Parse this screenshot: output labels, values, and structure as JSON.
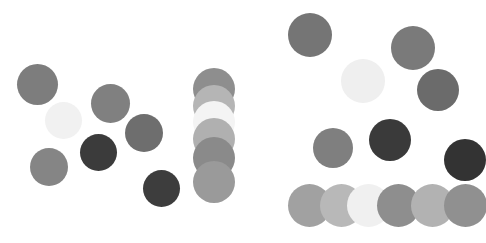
{
  "figure": {
    "width": 486,
    "height": 243,
    "background_color": "#ffffff",
    "panel_count": 2
  },
  "panels": [
    {
      "name": "left-panel",
      "origin_x": 0,
      "origin_y": 0,
      "width": 243,
      "height": 243,
      "dots": [
        {
          "name": "dot-l1",
          "cx": 37,
          "cy": 84,
          "r": 20.5,
          "color": "#7d7d7d"
        },
        {
          "name": "dot-l2",
          "cx": 63,
          "cy": 120,
          "r": 18.5,
          "color": "#f1f1f1"
        },
        {
          "name": "dot-l3",
          "cx": 110,
          "cy": 103,
          "r": 19.5,
          "color": "#808080"
        },
        {
          "name": "dot-l4",
          "cx": 98,
          "cy": 152,
          "r": 18.5,
          "color": "#3b3b3b"
        },
        {
          "name": "dot-l5",
          "cx": 49,
          "cy": 167,
          "r": 19.0,
          "color": "#858585"
        },
        {
          "name": "dot-l6",
          "cx": 144,
          "cy": 133,
          "r": 19.0,
          "color": "#6e6e6e"
        },
        {
          "name": "dot-l7",
          "cx": 161,
          "cy": 188,
          "r": 18.5,
          "color": "#3d3d3d"
        },
        {
          "name": "dot-c1",
          "cx": 214,
          "cy": 89,
          "r": 21.0,
          "color": "#8e8e8e"
        },
        {
          "name": "dot-c2",
          "cx": 214,
          "cy": 106,
          "r": 21.0,
          "color": "#b5b5b5"
        },
        {
          "name": "dot-c3",
          "cx": 214,
          "cy": 122,
          "r": 21.0,
          "color": "#f4f4f4"
        },
        {
          "name": "dot-c4",
          "cx": 214,
          "cy": 139,
          "r": 21.0,
          "color": "#b0b0b0"
        },
        {
          "name": "dot-c5",
          "cx": 214,
          "cy": 158,
          "r": 21.0,
          "color": "#8a8a8a"
        },
        {
          "name": "dot-c6",
          "cx": 214,
          "cy": 182,
          "r": 21.0,
          "color": "#9a9a9a"
        }
      ]
    },
    {
      "name": "right-panel",
      "origin_x": 243,
      "origin_y": 0,
      "width": 243,
      "height": 243,
      "dots": [
        {
          "name": "dot-r1",
          "cx": 310,
          "cy": 35,
          "r": 22.0,
          "color": "#757575"
        },
        {
          "name": "dot-r2",
          "cx": 413,
          "cy": 48,
          "r": 22.0,
          "color": "#7a7a7a"
        },
        {
          "name": "dot-r3",
          "cx": 363,
          "cy": 81,
          "r": 22.0,
          "color": "#efefef"
        },
        {
          "name": "dot-r4",
          "cx": 438,
          "cy": 90,
          "r": 21.0,
          "color": "#6b6b6b"
        },
        {
          "name": "dot-r5",
          "cx": 333,
          "cy": 148,
          "r": 20.0,
          "color": "#7f7f7f"
        },
        {
          "name": "dot-r6",
          "cx": 390,
          "cy": 140,
          "r": 21.0,
          "color": "#3a3a3a"
        },
        {
          "name": "dot-r7",
          "cx": 465,
          "cy": 160,
          "r": 21.0,
          "color": "#333333"
        },
        {
          "name": "dot-b1",
          "cx": 309,
          "cy": 205,
          "r": 21.5,
          "color": "#a1a1a1"
        },
        {
          "name": "dot-b2",
          "cx": 341,
          "cy": 205,
          "r": 21.5,
          "color": "#b8b8b8"
        },
        {
          "name": "dot-b3",
          "cx": 368,
          "cy": 205,
          "r": 21.5,
          "color": "#f0f0f0"
        },
        {
          "name": "dot-b4",
          "cx": 398,
          "cy": 205,
          "r": 21.5,
          "color": "#8e8e8e"
        },
        {
          "name": "dot-b5",
          "cx": 432,
          "cy": 205,
          "r": 21.5,
          "color": "#b2b2b2"
        },
        {
          "name": "dot-b6",
          "cx": 465,
          "cy": 205,
          "r": 21.5,
          "color": "#909090"
        }
      ]
    }
  ],
  "chart_data": {
    "type": "scatter",
    "subtitle": "",
    "xlabel": "",
    "ylabel": "",
    "xlim": [
      0,
      486
    ],
    "ylim": [
      0,
      243
    ],
    "grid": false,
    "legend": null,
    "axes_visible": false,
    "tick_labels_x": [],
    "tick_labels_y": [],
    "marker": "circle",
    "note": "Two side-by-side panels of filled grey circles of varying lightness; no axes, labels or legend rendered.",
    "series": [
      {
        "name": "left-panel-scatter",
        "points": [
          {
            "x": 37,
            "y": 84,
            "r": 20.5,
            "color": "#7d7d7d"
          },
          {
            "x": 63,
            "y": 120,
            "r": 18.5,
            "color": "#f1f1f1"
          },
          {
            "x": 110,
            "y": 103,
            "r": 19.5,
            "color": "#808080"
          },
          {
            "x": 98,
            "y": 152,
            "r": 18.5,
            "color": "#3b3b3b"
          },
          {
            "x": 49,
            "y": 167,
            "r": 19.0,
            "color": "#858585"
          },
          {
            "x": 144,
            "y": 133,
            "r": 19.0,
            "color": "#6e6e6e"
          },
          {
            "x": 161,
            "y": 188,
            "r": 18.5,
            "color": "#3d3d3d"
          }
        ]
      },
      {
        "name": "left-panel-column-stack",
        "points": [
          {
            "x": 214,
            "y": 89,
            "r": 21.0,
            "color": "#8e8e8e"
          },
          {
            "x": 214,
            "y": 106,
            "r": 21.0,
            "color": "#b5b5b5"
          },
          {
            "x": 214,
            "y": 122,
            "r": 21.0,
            "color": "#f4f4f4"
          },
          {
            "x": 214,
            "y": 139,
            "r": 21.0,
            "color": "#b0b0b0"
          },
          {
            "x": 214,
            "y": 158,
            "r": 21.0,
            "color": "#8a8a8a"
          },
          {
            "x": 214,
            "y": 182,
            "r": 21.0,
            "color": "#9a9a9a"
          }
        ]
      },
      {
        "name": "right-panel-scatter",
        "points": [
          {
            "x": 310,
            "y": 35,
            "r": 22.0,
            "color": "#757575"
          },
          {
            "x": 413,
            "y": 48,
            "r": 22.0,
            "color": "#7a7a7a"
          },
          {
            "x": 363,
            "y": 81,
            "r": 22.0,
            "color": "#efefef"
          },
          {
            "x": 438,
            "y": 90,
            "r": 21.0,
            "color": "#6b6b6b"
          },
          {
            "x": 333,
            "y": 148,
            "r": 20.0,
            "color": "#7f7f7f"
          },
          {
            "x": 390,
            "y": 140,
            "r": 21.0,
            "color": "#3a3a3a"
          },
          {
            "x": 465,
            "y": 160,
            "r": 21.0,
            "color": "#333333"
          }
        ]
      },
      {
        "name": "right-panel-bottom-row",
        "points": [
          {
            "x": 309,
            "y": 205,
            "r": 21.5,
            "color": "#a1a1a1"
          },
          {
            "x": 341,
            "y": 205,
            "r": 21.5,
            "color": "#b8b8b8"
          },
          {
            "x": 368,
            "y": 205,
            "r": 21.5,
            "color": "#f0f0f0"
          },
          {
            "x": 398,
            "y": 205,
            "r": 21.5,
            "color": "#8e8e8e"
          },
          {
            "x": 432,
            "y": 205,
            "r": 21.5,
            "color": "#b2b2b2"
          },
          {
            "x": 465,
            "y": 205,
            "r": 21.5,
            "color": "#909090"
          }
        ]
      }
    ]
  }
}
